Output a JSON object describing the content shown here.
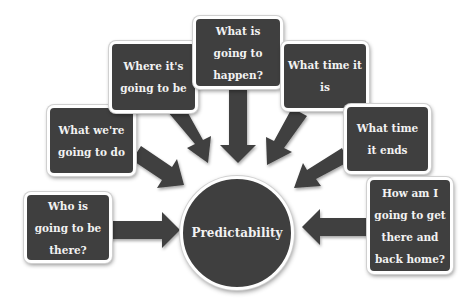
{
  "diagram": {
    "center": {
      "label": "Predictability"
    },
    "nodes": [
      {
        "id": "who",
        "label": "Who is going to be there?"
      },
      {
        "id": "what-do",
        "label": "What we're going to do"
      },
      {
        "id": "where",
        "label": "Where it's going to be"
      },
      {
        "id": "happen",
        "label": "What is going to happen?"
      },
      {
        "id": "time",
        "label": "What time it is"
      },
      {
        "id": "ends",
        "label": "What time it ends"
      },
      {
        "id": "travel",
        "label": "How am I going to get there and back home?"
      }
    ],
    "colors": {
      "box": "#3f3f3f",
      "text": "#f2f2f2",
      "border": "#ffffff",
      "arrow": "#3f3f3f"
    }
  }
}
